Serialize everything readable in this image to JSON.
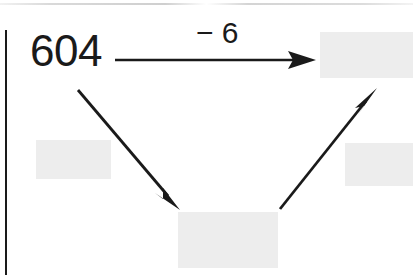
{
  "page": {
    "width": 413,
    "height": 275,
    "background_color": "#ffffff",
    "ink_color": "#1a1a1a",
    "blank_box_color": "#ededed",
    "margin_rule_color": "#1a1a1a"
  },
  "diagram": {
    "type": "arrow-chain-number-diagram",
    "start_value": "604",
    "operation_label": "− 6",
    "nodes": [
      {
        "name": "start-number",
        "text": "604",
        "kind": "value"
      },
      {
        "name": "top-right-answer",
        "text": "",
        "kind": "blank"
      },
      {
        "name": "bottom-answer",
        "text": "",
        "kind": "blank"
      },
      {
        "name": "left-blank",
        "text": "",
        "kind": "blank"
      },
      {
        "name": "right-blank",
        "text": "",
        "kind": "blank"
      }
    ],
    "arrows": [
      {
        "name": "arrow-right",
        "from": "start-number",
        "to": "top-right-answer",
        "label": "− 6",
        "direction": "right"
      },
      {
        "name": "arrow-down-right",
        "from": "start-number",
        "to": "bottom-answer",
        "label": "",
        "direction": "down-right"
      },
      {
        "name": "arrow-up-right",
        "from": "bottom-answer",
        "to": "top-right-answer",
        "label": "",
        "direction": "up-right"
      }
    ]
  }
}
